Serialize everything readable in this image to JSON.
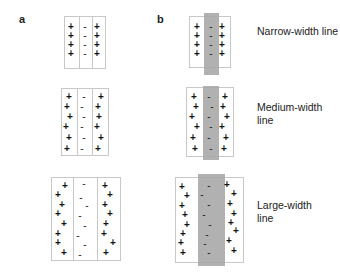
{
  "panels": {
    "a": {
      "label": "a"
    },
    "b": {
      "label": "b"
    }
  },
  "rows": [
    {
      "caption": "Narrow-width line",
      "caption_lines": [
        "Narrow-width line"
      ]
    },
    {
      "caption": "Medium-width line",
      "caption_lines": [
        "Medium-width",
        "line"
      ]
    },
    {
      "caption": "Large-width line",
      "caption_lines": [
        "Large-width",
        "line"
      ]
    }
  ],
  "symbols": {
    "positive": "+",
    "negative": "-"
  },
  "colors": {
    "band": "#a8a8a8",
    "border": "#c8c8c8",
    "text": "#222222"
  }
}
